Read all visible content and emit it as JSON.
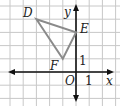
{
  "diagram": {
    "type": "coordinate-plane",
    "grid": {
      "origin_px": [
        76,
        72
      ],
      "cell_px": 13.2,
      "x_range": [
        -5,
        3
      ],
      "y_range": [
        -2,
        5
      ],
      "grid_color": "#c8c8c8",
      "axis_color": "#111111"
    },
    "axes": {
      "x_label": "x",
      "y_label": "y",
      "origin_label": "O",
      "x_tick_label": "1",
      "y_tick_label": "1"
    },
    "triangle": {
      "stroke_color": "#8a8a8a",
      "vertices": [
        {
          "name": "D",
          "x": -3,
          "y": 4
        },
        {
          "name": "E",
          "x": 0,
          "y": 3
        },
        {
          "name": "F",
          "x": -1,
          "y": 1
        }
      ]
    }
  }
}
